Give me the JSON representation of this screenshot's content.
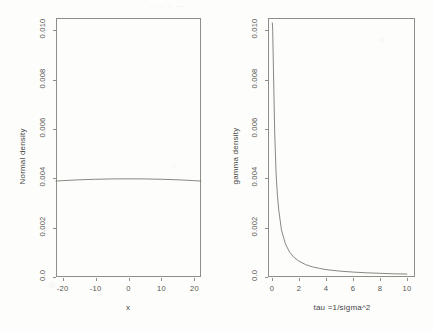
{
  "figure": {
    "background_color": "#fdfdfc",
    "line_color": "#7b7b72",
    "axis_color": "#8e8e86",
    "text_color": "#55554f",
    "ghost_text": "...  ..  .. ...."
  },
  "chart_data": [
    {
      "type": "line",
      "panel": "left",
      "title": "",
      "xlabel": "x",
      "ylabel": "Normal density",
      "xlim": [
        -22,
        22
      ],
      "ylim": [
        0.0,
        0.0105
      ],
      "grid": false,
      "legend": "none",
      "xticks": [
        -20,
        -10,
        0,
        10,
        20
      ],
      "xticklabels": [
        "-20",
        "-10",
        "0",
        "10",
        "20"
      ],
      "yticks": [
        0.0,
        0.002,
        0.004,
        0.006,
        0.008,
        0.01
      ],
      "yticklabels": [
        "0.0",
        "0.002",
        "0.004",
        "0.006",
        "0.008",
        "0.010"
      ],
      "description": "Near-flat normal density with very large variance",
      "x": [
        -22,
        -20,
        -15,
        -10,
        -5,
        0,
        5,
        10,
        15,
        20,
        22
      ],
      "values": [
        0.003889,
        0.003906,
        0.00394,
        0.003962,
        0.003976,
        0.003979,
        0.003976,
        0.003962,
        0.00394,
        0.003906,
        0.003889
      ]
    },
    {
      "type": "line",
      "panel": "right",
      "title": "",
      "xlabel": "tau =1/sigma^2",
      "ylabel": "gamma density",
      "xlim": [
        -0.3,
        10.6
      ],
      "ylim": [
        0.0,
        0.0105
      ],
      "grid": false,
      "legend": "none",
      "xticks": [
        0,
        2,
        4,
        6,
        8,
        10
      ],
      "xticklabels": [
        "0",
        "2",
        "4",
        "6",
        "8",
        "10"
      ],
      "yticks": [
        0.0,
        0.002,
        0.004,
        0.006,
        0.008,
        0.01
      ],
      "yticklabels": [
        "0.0",
        "0.002",
        "0.004",
        "0.006",
        "0.008",
        "0.010"
      ],
      "description": "Steeply decaying gamma density, hyperbolic shape approaching zero",
      "x": [
        0.02,
        0.05,
        0.1,
        0.2,
        0.3,
        0.4,
        0.5,
        0.7,
        1.0,
        1.3,
        1.6,
        2.0,
        2.5,
        3.0,
        3.5,
        4.0,
        5.0,
        6.0,
        7.0,
        8.0,
        9.0,
        10.0
      ],
      "values": [
        0.0103,
        0.01,
        0.0085,
        0.0058,
        0.0042,
        0.0033,
        0.0027,
        0.0019,
        0.00133,
        0.00101,
        0.00081,
        0.00064,
        0.0005,
        0.00041,
        0.00035,
        0.0003,
        0.00024,
        0.0002,
        0.00017,
        0.00015,
        0.00013,
        0.00012
      ]
    }
  ]
}
